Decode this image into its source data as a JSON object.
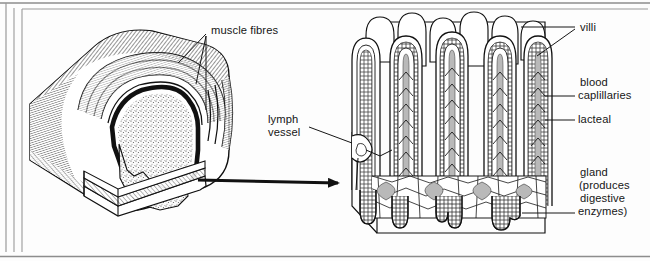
{
  "figure": {
    "labels": {
      "muscle_fibres": "muscle fibres",
      "lymph_vessel_line1": "lymph",
      "lymph_vessel_line2": "vessel",
      "villi": "villi",
      "blood_line1": "blood",
      "blood_line2": "caplillaries",
      "lacteal": "lacteal",
      "gland_line1": "gland",
      "gland_line2": "(produces",
      "gland_line3": "digestive",
      "gland_line4": "enzymes)"
    },
    "parts": {
      "intestine_cylinder": "cut-away intestine cylinder",
      "villi_block": "magnified villi block",
      "magnify_arrow": "magnification arrow"
    },
    "colors": {
      "ink": "#111111",
      "paper": "#fdfdfd",
      "border": "#888888",
      "lumen_fill": "#fafafa",
      "lacteal_gray": "#b9b9b9",
      "tissue_gray": "#d8d8d8"
    }
  }
}
